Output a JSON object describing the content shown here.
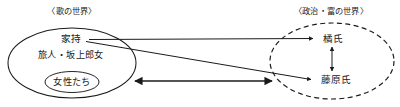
{
  "diagram": {
    "title_left": "〈歌の世界〉",
    "title_right": "〈政治・富の世界〉",
    "left_world": {
      "primary_node": "家持",
      "secondary_node": "旅人・坂上郎女",
      "inner_group": "女性たち"
    },
    "right_world": {
      "node_top": "橘氏",
      "node_bottom": "藤原氏"
    },
    "colors": {
      "ink": "#1a1a1a",
      "background": "#ffffff"
    },
    "connections": [
      {
        "id": "yakamochi-to-tachibana",
        "from": "家持",
        "to": "橘氏",
        "style": "solid",
        "arrow": "single"
      },
      {
        "id": "yakamochi-to-fujiwara",
        "from": "家持",
        "to": "藤原氏",
        "style": "solid",
        "arrow": "single"
      },
      {
        "id": "tachibana-fujiwara",
        "from": "橘氏",
        "to": "藤原氏",
        "style": "solid",
        "arrow": "double"
      },
      {
        "id": "women-to-political-world",
        "from": "女性たち",
        "to": "〈政治・富の世界〉",
        "style": "solid",
        "arrow": "double"
      }
    ]
  }
}
